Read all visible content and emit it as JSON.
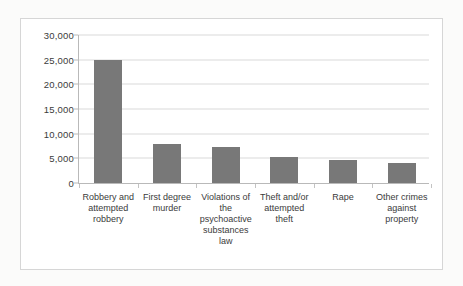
{
  "chart_data": {
    "type": "bar",
    "title": "",
    "xlabel": "",
    "ylabel": "",
    "categories": [
      "Robbery and attempted robbery",
      "First degree murder",
      "Violations of the psychoactive substances law",
      "Theft and/or attempted theft",
      "Rape",
      "Other crimes against property"
    ],
    "values": [
      25000,
      7900,
      7200,
      5200,
      4600,
      4000
    ],
    "ylim": [
      0,
      30000
    ],
    "ytick_values": [
      0,
      5000,
      10000,
      15000,
      20000,
      25000,
      30000
    ],
    "ytick_labels": [
      "0",
      "5,000",
      "10,000",
      "15,000",
      "20,000",
      "25,000",
      "30,000"
    ],
    "grid": true,
    "legend": false,
    "bar_color": "#787878",
    "gridline_color": "#d9d9d9",
    "axis_color": "#b9b9b9",
    "plot_background": "#ffffff",
    "border_color": "#d6d6d6"
  }
}
